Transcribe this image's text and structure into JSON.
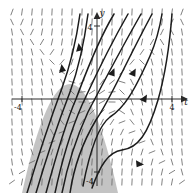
{
  "figure": {
    "name": "slope-field-with-solution-curves",
    "background": "#ffffff",
    "width": 194,
    "height": 193
  },
  "axes": {
    "horizontal": {
      "label": "t",
      "label_x": 186,
      "label_y": 104,
      "y_pixel": 99,
      "x_start": 12,
      "x_end": 182,
      "color": "#2a2a2a"
    },
    "vertical": {
      "label": "y",
      "label_x": 101,
      "label_y": 15,
      "x_pixel": 97,
      "y_start": 12,
      "y_end": 186,
      "color": "#2a2a2a"
    },
    "ticks": [
      {
        "name": "tick-t-negative-4",
        "label": "-4",
        "x": 22,
        "y": 99,
        "label_x": 14,
        "label_y": 110
      },
      {
        "name": "tick-t-positive-4",
        "label": "4",
        "x": 172,
        "y": 99,
        "label_x": 169,
        "label_y": 110
      },
      {
        "name": "tick-y-positive-4",
        "label": "4",
        "x": 97,
        "y": 26,
        "label_x": 88,
        "label_y": 29
      },
      {
        "name": "tick-y-negative-4",
        "label": "-4",
        "x": 97,
        "y": 172,
        "label_x": 88,
        "label_y": 183
      }
    ]
  },
  "slope_field": {
    "name": "direction-field",
    "x_min": 12,
    "x_max": 182,
    "y_min": 12,
    "y_max": 182,
    "columns": 18,
    "rows": 18,
    "stroke": "#6a6a6a",
    "stroke_width": 0.85,
    "segment_length": 7,
    "description": "near-vertical short dashes, slope steepens away from the parabola"
  },
  "shaded_region": {
    "name": "parabolic-shaded-region",
    "fill": "#b9b9b9",
    "opacity": 0.85,
    "vertex_x": 70,
    "vertex_y": 71,
    "left_base_x": 22,
    "right_base_x": 118,
    "base_y": 193,
    "description": "downward-opening parabola shaded gray, apex above the t-axis left of origin"
  },
  "curves": {
    "stroke": "#1c1c1c",
    "stroke_width": 1.5,
    "count": 8,
    "arrow_color": "#1c1c1c",
    "items": [
      {
        "name": "solution-curve-1",
        "arrow_at": "upper-left",
        "direction": "upward"
      },
      {
        "name": "solution-curve-2",
        "arrow_at": "upper-left",
        "direction": "upward"
      },
      {
        "name": "solution-curve-3",
        "arrow_at": "mid-left",
        "direction": "upward"
      },
      {
        "name": "solution-curve-4",
        "arrow_at": "center",
        "direction": "upward"
      },
      {
        "name": "solution-curve-5",
        "arrow_at": "center-right",
        "direction": "upward"
      },
      {
        "name": "solution-curve-6",
        "arrow_at": "right",
        "direction": "upward"
      },
      {
        "name": "solution-curve-7",
        "arrow_at": "lower-right",
        "direction": "upward"
      },
      {
        "name": "solution-curve-8",
        "arrow_at": "lower-right",
        "direction": "upward"
      }
    ]
  },
  "chart_data": {
    "type": "line",
    "title": "",
    "xlabel": "t",
    "ylabel": "y",
    "xlim": [
      -4.8,
      4.8
    ],
    "ylim": [
      -5.3,
      5.0
    ],
    "xticks": [
      -4,
      4
    ],
    "yticks": [
      -4,
      4
    ],
    "grid": false,
    "legend": null,
    "annotations": [
      "direction field of short near-vertical segments over the whole plane",
      "gray shaded downward-opening parabolic region",
      "eight solution trajectories with upward arrowheads"
    ]
  }
}
